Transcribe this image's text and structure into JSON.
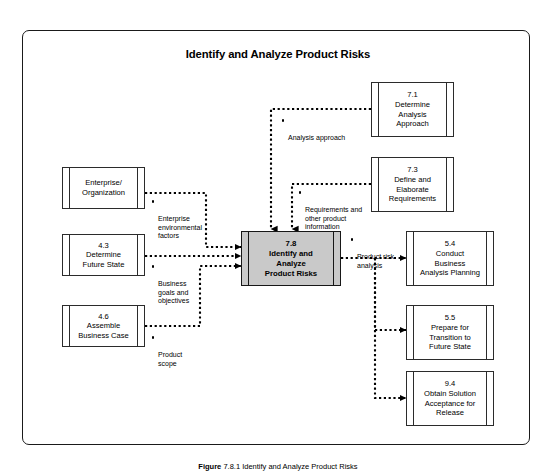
{
  "figure": {
    "title": "Identify and Analyze Product Risks",
    "caption_prefix": "Figure",
    "caption": "7.8.1 Identify and Analyze Product Risks"
  },
  "colors": {
    "frame_border": "#1a1a1a",
    "box_border": "#2b2b2b",
    "focus_fill": "#c9c9c9",
    "focus_border": "#171717",
    "connector": "#000000",
    "text": "#000000",
    "background": "#ffffff"
  },
  "focus_process": {
    "id": "7.8",
    "name": "Identify and\nAnalyze\nProduct Risks",
    "label": "7.8\nIdentify and\nAnalyze\nProduct Risks"
  },
  "inputs": [
    {
      "id": "entity-enterprise-organization",
      "number": "",
      "name": "Enterprise/\nOrganization",
      "label": "Enterprise/\nOrganization",
      "flow_label": "Enterprise\nenvironmental\nfactors"
    },
    {
      "id": "process-4-3",
      "number": "4.3",
      "name": "Determine\nFuture State",
      "label": "4.3\nDetermine\nFuture State",
      "flow_label": "Business\ngoals and\nobjectives"
    },
    {
      "id": "process-4-6",
      "number": "4.6",
      "name": "Assemble\nBusiness Case",
      "label": "4.6\nAssemble\nBusiness Case",
      "flow_label": "Product\nscope"
    }
  ],
  "top_inputs": [
    {
      "id": "process-7-1",
      "number": "7.1",
      "name": "Determine\nAnalysis\nApproach",
      "label": "7.1\nDetermine\nAnalysis\nApproach",
      "flow_label": "Analysis approach"
    },
    {
      "id": "process-7-3",
      "number": "7.3",
      "name": "Define and\nElaborate\nRequirements",
      "label": "7.3\nDefine and\nElaborate\nRequirements",
      "flow_label": "Requirements and\nother product\ninformation"
    }
  ],
  "outputs": [
    {
      "id": "process-5-4",
      "number": "5.4",
      "name": "Conduct\nBusiness\nAnalysis Planning",
      "label": "5.4\nConduct\nBusiness\nAnalysis Planning"
    },
    {
      "id": "process-5-5",
      "number": "5.5",
      "name": "Prepare for\nTransition to\nFuture State",
      "label": "5.5\nPrepare for\nTransition to\nFuture State"
    },
    {
      "id": "process-9-4",
      "number": "9.4",
      "name": "Obtain Solution\nAcceptance for\nRelease",
      "label": "9.4\nObtain Solution\nAcceptance for\nRelease"
    }
  ],
  "output_flow_label": "Product risk\nanalysis"
}
